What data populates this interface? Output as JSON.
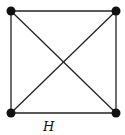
{
  "diagram": {
    "type": "graph",
    "label": "H",
    "nodes": [
      {
        "id": "tl",
        "x": 11,
        "y": 11
      },
      {
        "id": "tr",
        "x": 116,
        "y": 11
      },
      {
        "id": "bl",
        "x": 11,
        "y": 113
      },
      {
        "id": "br",
        "x": 116,
        "y": 113
      }
    ],
    "edges": [
      [
        "tl",
        "tr"
      ],
      [
        "tr",
        "br"
      ],
      [
        "br",
        "bl"
      ],
      [
        "bl",
        "tl"
      ],
      [
        "tl",
        "br"
      ],
      [
        "tr",
        "bl"
      ]
    ],
    "colors": {
      "line": "#222222",
      "node": "#111111"
    }
  }
}
